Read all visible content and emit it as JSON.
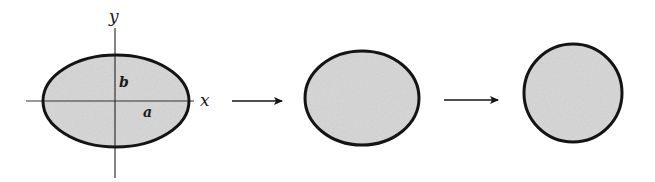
{
  "diagram": {
    "colors": {
      "fill": "#d9d9d9",
      "stroke": "#141414",
      "axis": "#333333",
      "background": "#ffffff"
    },
    "stage1": {
      "shape": "ellipse",
      "axis_labels": {
        "x": "x",
        "y": "y"
      },
      "semi_axis_labels": {
        "a": "a",
        "b": "b"
      }
    },
    "stage2": {
      "shape": "ellipse"
    },
    "stage3": {
      "shape": "circle"
    },
    "arrows": [
      "arrow-1",
      "arrow-2"
    ]
  }
}
